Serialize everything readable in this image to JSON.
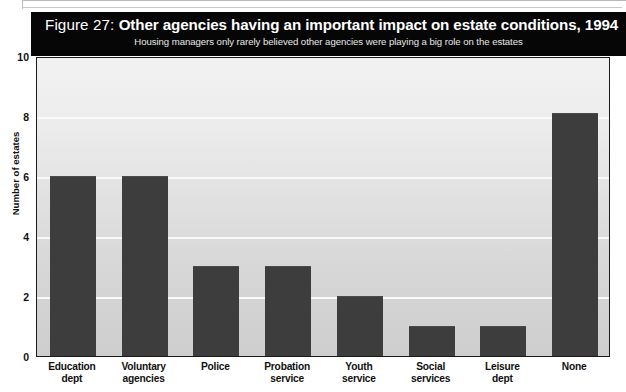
{
  "figure": {
    "number_label": "Figure 27:",
    "title": "Other agencies having an important impact on estate conditions, 1994",
    "subtitle": "Housing managers only rarely believed other agencies were playing a big role on the estates"
  },
  "colors": {
    "banner_background": "#060606",
    "banner_text": "#ffffff",
    "bar_fill": "#3d3d3d",
    "plot_background_top": "#f2f2f2",
    "plot_background_bottom": "#cecece",
    "gridline": "#fbfbfb",
    "axis_line": "#1b1b1b"
  },
  "chart_data": {
    "type": "bar",
    "title": "Other agencies having an important impact on estate conditions, 1994",
    "subtitle": "Housing managers only rarely believed other agencies were playing a big role on the estates",
    "xlabel": "",
    "ylabel": "Number of estates",
    "ylim": [
      0,
      10
    ],
    "yticks": [
      0,
      2,
      4,
      6,
      8,
      10
    ],
    "ytick_labels": [
      "0",
      "2",
      "4",
      "6",
      "8",
      "10"
    ],
    "grid": true,
    "grid_axis": "y",
    "legend": false,
    "orientation": "vertical",
    "categories": [
      "Education dept",
      "Voluntary agencies",
      "Police",
      "Probation service",
      "Youth service",
      "Social services",
      "Leisure dept",
      "None"
    ],
    "category_lines": [
      [
        "Education",
        "dept"
      ],
      [
        "Voluntary",
        "agencies"
      ],
      [
        "Police",
        ""
      ],
      [
        "Probation",
        "service"
      ],
      [
        "Youth",
        "service"
      ],
      [
        "Social",
        "services"
      ],
      [
        "Leisure",
        "dept"
      ],
      [
        "None",
        ""
      ]
    ],
    "values": [
      6,
      6,
      3,
      3,
      2,
      1,
      1,
      8.1
    ]
  }
}
